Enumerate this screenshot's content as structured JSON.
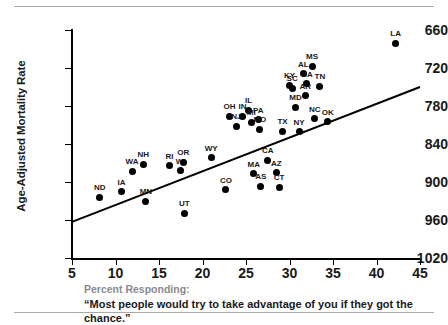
{
  "figure": {
    "rule_top": "horizontal-rule",
    "rule_bottom": "horizontal-rule"
  },
  "caption": {
    "lead": "Percent Responding:",
    "quote": "“Most people would try to take advantage of you if they got the chance.”"
  },
  "chart_data": {
    "type": "scatter",
    "title": "",
    "xlabel": "Percent Responding: “Most people would try to take advantage of you if they got the chance.”",
    "ylabel": "Age-Adjusted Mortality Rate",
    "xlim": [
      5,
      45
    ],
    "ylim": [
      660,
      1020
    ],
    "xticks": [
      5,
      10,
      15,
      20,
      25,
      30,
      35,
      40,
      45
    ],
    "yticks": [
      660,
      720,
      780,
      840,
      900,
      960,
      1020
    ],
    "grid": false,
    "legend": "none",
    "trendline": {
      "show": true,
      "x_start": 5,
      "y_start": 717,
      "x_end": 45,
      "y_end": 930
    },
    "point_color": "#000000",
    "points": [
      {
        "label": "ND",
        "x": 8.2,
        "y": 756
      },
      {
        "label": "IA",
        "x": 10.7,
        "y": 765
      },
      {
        "label": "WA",
        "x": 11.9,
        "y": 797
      },
      {
        "label": "NH",
        "x": 13.2,
        "y": 808
      },
      {
        "label": "MN",
        "x": 13.5,
        "y": 750
      },
      {
        "label": "RI",
        "x": 16.2,
        "y": 806
      },
      {
        "label": "WI",
        "x": 17.5,
        "y": 798
      },
      {
        "label": "OR",
        "x": 17.8,
        "y": 811
      },
      {
        "label": "UT",
        "x": 17.9,
        "y": 731
      },
      {
        "label": "WY",
        "x": 21.0,
        "y": 818
      },
      {
        "label": "CO",
        "x": 22.7,
        "y": 768
      },
      {
        "label": "OH",
        "x": 23.1,
        "y": 884
      },
      {
        "label": "NJ",
        "x": 23.9,
        "y": 868
      },
      {
        "label": "IN",
        "x": 24.6,
        "y": 884
      },
      {
        "label": "IL",
        "x": 25.3,
        "y": 893
      },
      {
        "label": "MI",
        "x": 25.6,
        "y": 874
      },
      {
        "label": "MA",
        "x": 25.9,
        "y": 793
      },
      {
        "label": "PA",
        "x": 26.4,
        "y": 878
      },
      {
        "label": "MO",
        "x": 26.6,
        "y": 863
      },
      {
        "label": "AS",
        "x": 26.7,
        "y": 773
      },
      {
        "label": "CA",
        "x": 27.5,
        "y": 814
      },
      {
        "label": "AZ",
        "x": 28.5,
        "y": 795
      },
      {
        "label": "CT",
        "x": 28.8,
        "y": 772
      },
      {
        "label": "TX",
        "x": 29.2,
        "y": 860
      },
      {
        "label": "KY",
        "x": 30.0,
        "y": 933
      },
      {
        "label": "SC",
        "x": 30.3,
        "y": 928
      },
      {
        "label": "MD",
        "x": 30.7,
        "y": 898
      },
      {
        "label": "NY",
        "x": 31.1,
        "y": 859
      },
      {
        "label": "AL",
        "x": 31.6,
        "y": 951
      },
      {
        "label": "AR",
        "x": 31.8,
        "y": 916
      },
      {
        "label": "GA",
        "x": 32.0,
        "y": 935
      },
      {
        "label": "MS",
        "x": 32.6,
        "y": 963
      },
      {
        "label": "NC",
        "x": 32.9,
        "y": 880
      },
      {
        "label": "TN",
        "x": 33.5,
        "y": 931
      },
      {
        "label": "OK",
        "x": 34.4,
        "y": 875
      },
      {
        "label": "LA",
        "x": 42.2,
        "y": 999
      }
    ]
  },
  "axes": {
    "yticks_labels": [
      "1020",
      "960",
      "900",
      "840",
      "780",
      "720",
      "660"
    ],
    "xticks_labels": [
      "5",
      "10",
      "15",
      "20",
      "25",
      "30",
      "35",
      "40",
      "45"
    ],
    "y_title": "Age-Adjusted Mortality Rate"
  }
}
